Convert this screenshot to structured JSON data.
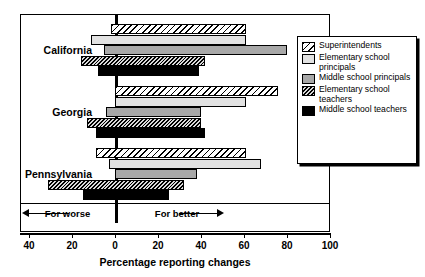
{
  "chart_data": {
    "type": "bar",
    "orientation": "horizontal",
    "title": "",
    "xlabel": "Percentage reporting changes",
    "ylabel": "",
    "xlim": [
      -40,
      100
    ],
    "xticks": [
      -40,
      -20,
      0,
      20,
      40,
      60,
      80,
      100
    ],
    "xticklabels": [
      "40",
      "20",
      "0",
      "20",
      "40",
      "60",
      "80",
      "100"
    ],
    "grid": false,
    "zero_reference_line": true,
    "categories": [
      "California",
      "Georgia",
      "Pennsylvania"
    ],
    "series": [
      {
        "name": "Superintendents",
        "pattern": "diagonal-hatch",
        "values_positive": [
          61,
          76,
          61
        ],
        "values_negative": [
          -2,
          0,
          -9
        ]
      },
      {
        "name": "Elementary school principals",
        "pattern": "light-gray",
        "values_positive": [
          61,
          61,
          68
        ],
        "values_negative": [
          -11,
          0,
          -3
        ]
      },
      {
        "name": "Middle school principals",
        "pattern": "medium-gray",
        "values_positive": [
          80,
          40,
          38
        ],
        "values_negative": [
          -5,
          -4,
          0
        ]
      },
      {
        "name": "Elementary school teachers",
        "pattern": "dense-hatch",
        "values_positive": [
          42,
          40,
          32
        ],
        "values_negative": [
          -16,
          -13,
          -31
        ]
      },
      {
        "name": "Middle school teachers",
        "pattern": "solid-black",
        "values_positive": [
          39,
          42,
          25
        ],
        "values_negative": [
          -8,
          -9,
          -15
        ]
      }
    ],
    "annotations": {
      "left_direction": "For worse",
      "right_direction": "For better"
    },
    "legend_position": "right"
  },
  "axis": {
    "title": "Percentage reporting changes",
    "ticklabels": [
      "40",
      "20",
      "0",
      "20",
      "40",
      "60",
      "80",
      "100"
    ]
  },
  "groups": [
    {
      "label": "California"
    },
    {
      "label": "Georgia"
    },
    {
      "label": "Pennsylvania"
    }
  ],
  "direction": {
    "worse": "For worse",
    "better": "For better"
  },
  "legend": {
    "items": [
      {
        "label": "Superintendents",
        "swatch": "diagonal-hatch-swatch"
      },
      {
        "label": "Elementary school principals",
        "swatch": "light-gray-swatch"
      },
      {
        "label": "Middle school principals",
        "swatch": "medium-gray-swatch"
      },
      {
        "label": "Elementary school teachers",
        "swatch": "dense-hatch-swatch"
      },
      {
        "label": "Middle school teachers",
        "swatch": "solid-black-swatch"
      }
    ]
  },
  "colors": {
    "elementary_principals": "#e2e2e2",
    "middle_principals": "#a8a8a8",
    "middle_teachers": "#000000",
    "frame": "#000000"
  }
}
